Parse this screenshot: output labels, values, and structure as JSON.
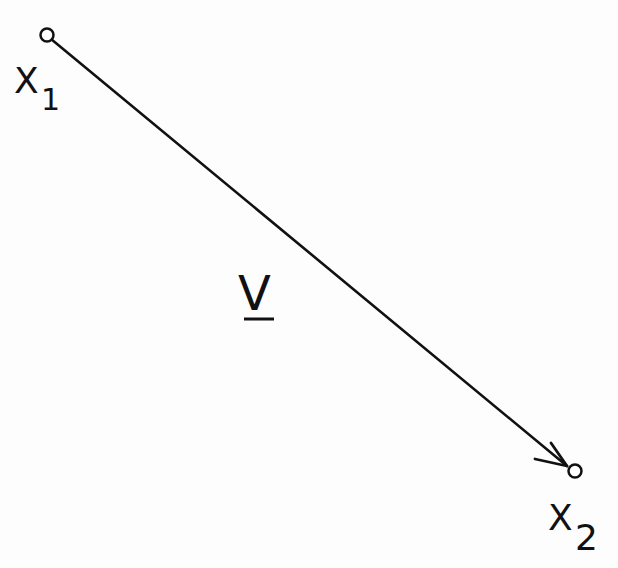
{
  "diagram": {
    "type": "vector",
    "start_point": {
      "label": "X",
      "subscript": "1",
      "x": 47,
      "y": 35
    },
    "end_point": {
      "label": "X",
      "subscript": "2",
      "x": 575,
      "y": 471
    },
    "vector": {
      "label": "V",
      "underlined": true
    },
    "colors": {
      "ink": "#111111",
      "background": "#fdfdfd"
    }
  }
}
